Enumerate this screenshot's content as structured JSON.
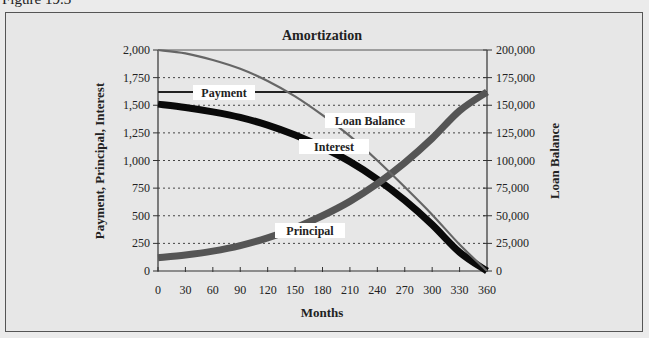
{
  "figure_label": "Figure 19.3",
  "chart_data": {
    "type": "line",
    "title": "Amortization",
    "xlabel": "Months",
    "ylabel_left": "Payment, Principal, Interest",
    "ylabel_right": "Loan Balance",
    "xlim": [
      0,
      360
    ],
    "ylim_left": [
      0,
      2000
    ],
    "ylim_right": [
      0,
      200000
    ],
    "x_ticks": [
      "0",
      "30",
      "60",
      "90",
      "120",
      "150",
      "180",
      "210",
      "240",
      "270",
      "300",
      "330",
      "360"
    ],
    "y_left_ticks": [
      "0",
      "250",
      "500",
      "750",
      "1,000",
      "1,250",
      "1,500",
      "1,750",
      "2,000"
    ],
    "y_right_ticks": [
      "0",
      "25,000",
      "50,000",
      "75,000",
      "100,000",
      "125,000",
      "150,000",
      "175,000",
      "200,000"
    ],
    "grid": "horizontal dotted",
    "x": [
      0,
      30,
      60,
      90,
      120,
      150,
      180,
      210,
      240,
      270,
      300,
      330,
      360
    ],
    "series": [
      {
        "name": "Payment",
        "axis": "left",
        "values": [
          1620,
          1620,
          1620,
          1620,
          1620,
          1620,
          1620,
          1620,
          1620,
          1620,
          1620,
          1620,
          1620
        ]
      },
      {
        "name": "Interest",
        "axis": "left",
        "values": [
          1510,
          1480,
          1440,
          1390,
          1320,
          1230,
          1120,
          990,
          830,
          640,
          420,
          170,
          0
        ]
      },
      {
        "name": "Principal",
        "axis": "left",
        "values": [
          120,
          145,
          180,
          230,
          300,
          390,
          500,
          630,
          790,
          980,
          1200,
          1450,
          1620
        ]
      },
      {
        "name": "Loan Balance",
        "axis": "right",
        "values": [
          200000,
          197000,
          191000,
          183000,
          172000,
          158000,
          141000,
          122000,
          100000,
          76000,
          51000,
          24000,
          0
        ]
      }
    ],
    "annotations": [
      "Payment",
      "Loan Balance",
      "Interest",
      "Principal"
    ]
  }
}
